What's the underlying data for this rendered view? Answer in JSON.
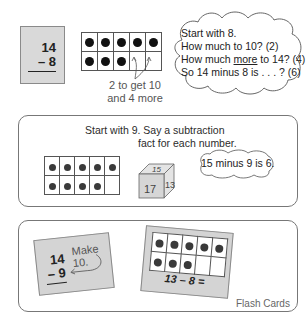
{
  "top_section": {
    "card": {
      "top": "14",
      "bottom": "8",
      "operator": "–"
    },
    "ten_frame": {
      "columns": 5,
      "rows": 2,
      "filled": 8
    },
    "note": {
      "line1": "2 to get 10",
      "line2": "and 4 more"
    },
    "thought_cloud": {
      "line1": "Start with 8.",
      "line2_pre": "How much to 10? (2)",
      "line3_pre": "How much ",
      "line3_emph": "more",
      "line3_post": " to 14? (4)",
      "line4": "So 14 minus 8 is . . . ? (6)"
    }
  },
  "middle_section": {
    "instruction": {
      "line1": "Start with 9. Say a subtraction",
      "line2": "fact for each number."
    },
    "ten_frame": {
      "columns": 5,
      "rows": 2,
      "filled": 9
    },
    "cube": {
      "top": "15",
      "front": "17",
      "side": "13"
    },
    "speech_cloud": "15 minus 9 is 6."
  },
  "bottom_section": {
    "card1": {
      "top": "14",
      "bottom": "9",
      "operator": "–",
      "hint": "Make 10."
    },
    "card2": {
      "ten_frame_filled": 8,
      "equation": "13 – 8 ="
    },
    "label": "Flash Cards"
  },
  "colors": {
    "card_gray": "#d9d9d9",
    "border": "#777777",
    "dot": "#111111",
    "text": "#2b2b2b"
  }
}
